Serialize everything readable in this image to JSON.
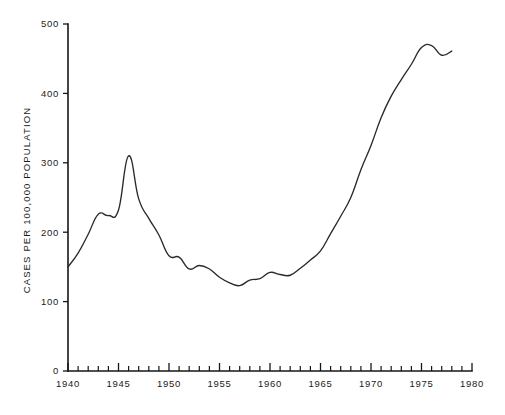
{
  "chart_data": {
    "type": "line",
    "title": "",
    "subtitle": "",
    "xlabel": "",
    "ylabel": "CASES PER 100,000 POPULATION",
    "xlim": [
      1940,
      1980
    ],
    "ylim": [
      0,
      500
    ],
    "grid": false,
    "legend": null,
    "x_tick_labels": [
      "1940",
      "1945",
      "1950",
      "1955",
      "1960",
      "1965",
      "1970",
      "1975",
      "1980"
    ],
    "x_tick_values": [
      1940,
      1945,
      1950,
      1955,
      1960,
      1965,
      1970,
      1975,
      1980
    ],
    "x_minor_tick_interval": 1,
    "y_tick_labels": [
      "0",
      "100",
      "200",
      "300",
      "400",
      "500"
    ],
    "y_tick_values": [
      0,
      100,
      200,
      300,
      400,
      500
    ],
    "line_color": "#2a2a2a",
    "background_color": "#ffffff",
    "x": [
      1940,
      1941,
      1942,
      1943,
      1944,
      1945,
      1946,
      1947,
      1948,
      1949,
      1950,
      1951,
      1952,
      1953,
      1954,
      1955,
      1956,
      1957,
      1958,
      1959,
      1960,
      1961,
      1962,
      1963,
      1964,
      1965,
      1966,
      1967,
      1968,
      1969,
      1970,
      1971,
      1972,
      1973,
      1974,
      1975,
      1976,
      1977,
      1978
    ],
    "values": [
      150,
      170,
      197,
      226,
      224,
      232,
      310,
      248,
      220,
      196,
      166,
      164,
      147,
      152,
      147,
      135,
      127,
      123,
      131,
      133,
      142,
      139,
      138,
      148,
      160,
      173,
      198,
      223,
      250,
      290,
      325,
      365,
      396,
      420,
      442,
      466,
      469,
      455,
      461
    ],
    "series": [
      {
        "name": "Cases per 100,000 population",
        "values": [
          150,
          170,
          197,
          226,
          224,
          232,
          310,
          248,
          220,
          196,
          166,
          164,
          147,
          152,
          147,
          135,
          127,
          123,
          131,
          133,
          142,
          139,
          138,
          148,
          160,
          173,
          198,
          223,
          250,
          290,
          325,
          365,
          396,
          420,
          442,
          466,
          469,
          455,
          461
        ]
      }
    ],
    "annotations": []
  },
  "axis": {
    "y_title": "CASES PER 100,000 POPULATION"
  }
}
